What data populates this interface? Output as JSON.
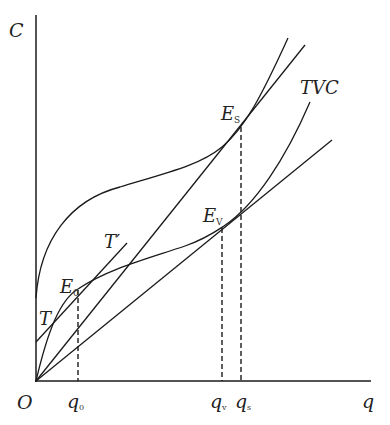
{
  "diagram": {
    "axes": {
      "y_label": "C",
      "x_label": "q",
      "origin_label": "O"
    },
    "curves": {
      "tc": {
        "name": "total-cost-curve"
      },
      "tvc": {
        "name": "TVC",
        "label": "TVC"
      },
      "tangent": {
        "label_start": "T",
        "label_end": "T′"
      },
      "ray_s": {
        "name": "ray-to-ES"
      },
      "ray_v": {
        "name": "ray-to-EV"
      }
    },
    "points": {
      "e0": {
        "main": "E",
        "sub": "0"
      },
      "es": {
        "main": "E",
        "sub": "S"
      },
      "ev": {
        "main": "E",
        "sub": "V"
      }
    },
    "x_ticks": {
      "q0": {
        "main": "q",
        "sub": "0"
      },
      "qv": {
        "main": "q",
        "sub": "v"
      },
      "qs": {
        "main": "q",
        "sub": "s"
      }
    }
  }
}
